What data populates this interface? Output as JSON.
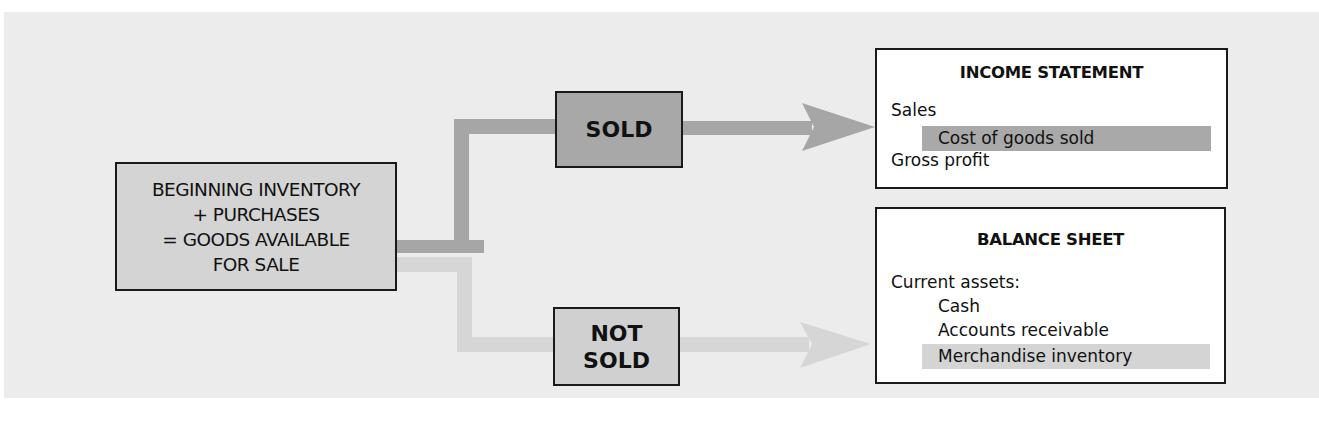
{
  "diagram": {
    "source": {
      "lines": [
        "BEGINNING INVENTORY",
        "+ PURCHASES",
        "= GOODS AVAILABLE",
        "FOR SALE"
      ]
    },
    "branches": {
      "sold": {
        "label": "SOLD",
        "color": "#a8a8a8"
      },
      "not_sold": {
        "line1": "NOT",
        "line2": "SOLD",
        "color": "#d0d0d0"
      }
    },
    "flow_colors": {
      "sold_arrow": "#a6a6a6",
      "not_sold_arrow": "#d6d6d6"
    },
    "income_statement": {
      "title": "INCOME STATEMENT",
      "lines": [
        "Sales",
        "Cost of goods sold",
        "Gross profit"
      ],
      "highlighted_line": "Cost of goods sold"
    },
    "balance_sheet": {
      "title": "BALANCE SHEET",
      "lines": [
        "Current assets:",
        "Cash",
        "Accounts receivable",
        "Merchandise inventory"
      ],
      "highlighted_line": "Merchandise inventory"
    }
  }
}
